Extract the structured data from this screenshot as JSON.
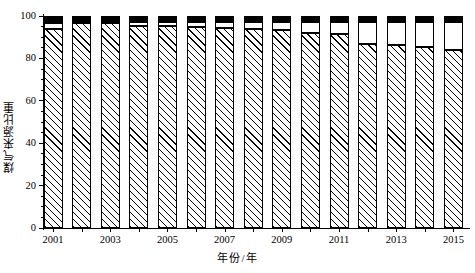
{
  "chart_data": {
    "type": "bar",
    "stacked": true,
    "title": "",
    "subtitle": "",
    "xlabel": "年份/年",
    "ylabel": "煤气来源比重",
    "ylim": [
      0,
      100
    ],
    "yticks": [
      0,
      20,
      40,
      60,
      80,
      100
    ],
    "yticklabels": [
      "0",
      "20",
      "40",
      "60",
      "80",
      "100"
    ],
    "y_minor_ticks": [
      5,
      10,
      15,
      25,
      30,
      35,
      45,
      50,
      55,
      65,
      70,
      75,
      85,
      90,
      95
    ],
    "grid": false,
    "legend": "none",
    "categories": [
      2001,
      2002,
      2003,
      2004,
      2005,
      2006,
      2007,
      2008,
      2009,
      2010,
      2011,
      2012,
      2013,
      2014,
      2015
    ],
    "xticklabels": [
      "2001",
      "",
      "2003",
      "",
      "2005",
      "",
      "2007",
      "",
      "2009",
      "",
      "2011",
      "",
      "2013",
      "",
      "2015"
    ],
    "xticklabels_shown": [
      "2001",
      "2003",
      "2005",
      "2007",
      "2009",
      "2011",
      "2013",
      "2015"
    ],
    "series": [
      {
        "name": "hatched-segment",
        "fill": "diagonal-hatch",
        "values": [
          94.0,
          96.5,
          96.5,
          95.5,
          95.5,
          95.0,
          94.5,
          94.0,
          93.5,
          92.0,
          91.5,
          87.0,
          86.5,
          85.5,
          84.0
        ]
      },
      {
        "name": "white-segment",
        "fill": "white",
        "values": [
          2.5,
          0.8,
          0.8,
          1.5,
          1.5,
          2.0,
          2.5,
          3.0,
          3.5,
          5.0,
          5.5,
          10.0,
          10.5,
          11.5,
          13.0
        ]
      },
      {
        "name": "black-segment",
        "fill": "black",
        "values": [
          3.5,
          2.7,
          2.7,
          3.0,
          3.0,
          3.0,
          3.0,
          3.0,
          3.0,
          3.0,
          3.0,
          3.0,
          3.0,
          3.0,
          3.0
        ]
      }
    ]
  }
}
